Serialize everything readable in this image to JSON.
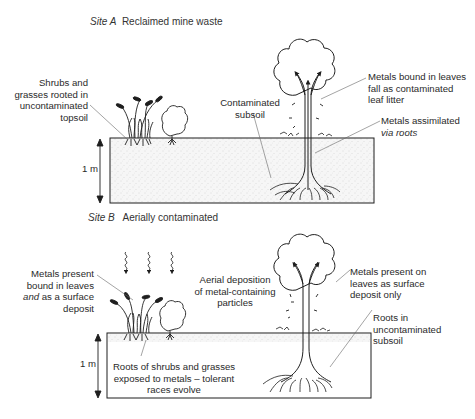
{
  "site_a": {
    "title_italic": "Site A",
    "title_rest": "Reclaimed mine waste",
    "labels": {
      "shrubs": [
        "Shrubs and",
        "grasses rooted in",
        "uncontaminated",
        "topsoil"
      ],
      "subsoil": [
        "Contaminated",
        "subsoil"
      ],
      "leaves": [
        "Metals bound in leaves",
        "fall as contaminated",
        "leaf litter"
      ],
      "roots": [
        "Metals assimilated",
        "via roots"
      ],
      "depth": "1 m"
    }
  },
  "site_b": {
    "title_italic": "Site B",
    "title_rest": "Aerially contaminated",
    "labels": {
      "metals_present": [
        "Metals present",
        "bound in leaves",
        "and as a surface",
        "deposit"
      ],
      "aerial": [
        "Aerial deposition",
        "of metal-containing",
        "particles"
      ],
      "surface_only": [
        "Metals present on",
        "leaves as surface",
        "deposit only"
      ],
      "roots_uncontam": [
        "Roots in",
        "uncontaminated",
        "subsoil"
      ],
      "roots_shrubs": [
        "Roots of shrubs and grasses",
        "exposed to metals – tolerant",
        "races evolve"
      ],
      "depth": "1 m"
    }
  },
  "colors": {
    "line": "#1e1e1e",
    "leader": "#555555",
    "soil": "#eeeeee"
  }
}
